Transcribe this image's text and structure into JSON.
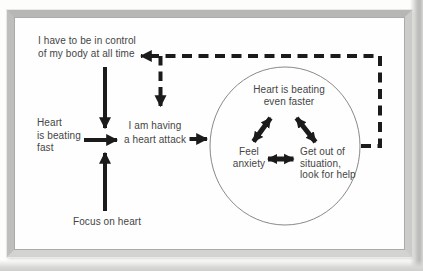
{
  "colors": {
    "ink": "#1b1b1b",
    "text": "#454545",
    "circle": "#7a7a7a",
    "paper": "#fdfdfc",
    "frame": "#c5c5c3"
  },
  "figure": {
    "nodes": {
      "control_belief": {
        "label": "I have to be in control\nof my body at all time"
      },
      "heart_fast": {
        "label": "Heart\nis beating\nfast"
      },
      "focus_heart": {
        "label": "Focus on heart"
      },
      "heart_attack": {
        "label": "I am having\na heart attack"
      },
      "heart_faster": {
        "label": "Heart is beating\neven faster"
      },
      "feel_anxiety": {
        "label": "Feel\nanxiety"
      },
      "get_out": {
        "label": "Get out of\nsituation,\nlook for help"
      }
    },
    "edges": [
      {
        "from": "control_belief",
        "to": "heart_attack_junction",
        "style": "solid"
      },
      {
        "from": "heart_fast",
        "to": "heart_attack",
        "style": "solid"
      },
      {
        "from": "focus_heart",
        "to": "heart_attack_junction",
        "style": "solid"
      },
      {
        "from": "heart_attack",
        "to": "cycle_circle",
        "style": "solid"
      },
      {
        "from": "cycle_circle",
        "to": "control_belief",
        "style": "dashed"
      },
      {
        "from": "cycle_circle",
        "to": "heart_attack",
        "style": "dashed"
      },
      {
        "from": "heart_faster",
        "to": "feel_anxiety",
        "style": "double-headed"
      },
      {
        "from": "heart_faster",
        "to": "get_out",
        "style": "double-headed"
      },
      {
        "from": "feel_anxiety",
        "to": "get_out",
        "style": "double-headed"
      }
    ]
  }
}
